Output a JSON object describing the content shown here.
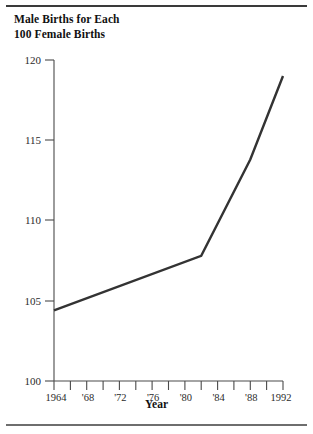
{
  "chart_data": {
    "type": "line",
    "title": "Male Births for Each\n 100 Female Births",
    "xlabel": "Year",
    "ylabel": "",
    "xlim": [
      1964,
      1992
    ],
    "ylim": [
      100,
      120
    ],
    "grid": false,
    "legend": "none",
    "x_tick_labels": [
      "1964",
      "",
      "'68",
      "",
      "'72",
      "",
      "'76",
      "",
      "'80",
      "",
      "'84",
      "",
      "'88",
      "",
      "1992"
    ],
    "x_tick_values": [
      1964,
      1966,
      1968,
      1970,
      1972,
      1974,
      1976,
      1978,
      1980,
      1982,
      1984,
      1986,
      1988,
      1990,
      1992
    ],
    "y_tick_labels": [
      "100",
      "105",
      "110",
      "115",
      "120"
    ],
    "y_tick_values": [
      100,
      105,
      110,
      115,
      120
    ],
    "series": [
      {
        "name": "Male births per 100 female births",
        "color": "#333333",
        "x": [
          1964,
          1982,
          1988,
          1992
        ],
        "values": [
          104.4,
          107.8,
          113.8,
          119.0
        ]
      }
    ]
  },
  "title_lines": [
    "Male Births for Each",
    "100 Female Births"
  ],
  "axis": {
    "x_title": "Year",
    "y_first": "100",
    "y_last": "120"
  },
  "colors": {
    "line": "#333333",
    "axis": "#4a4a4a",
    "text": "#1a1a1a",
    "rule": "#3a3a3a",
    "background": "#ffffff"
  }
}
